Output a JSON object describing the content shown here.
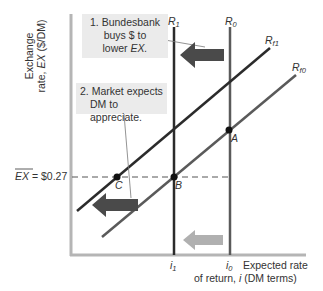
{
  "diagram": {
    "y_axis_label_line1": "Exchange",
    "y_axis_label_line2_prefix": "rate, ",
    "y_axis_label_var": "EX",
    "y_axis_label_unit": " ($/DM)",
    "x_axis_label_line1": "Expected rate",
    "x_axis_label_line2_prefix": "of return, ",
    "x_axis_label_var": "i",
    "x_axis_label_unit": " (DM terms)",
    "note1": {
      "line1": "1. Bundesbank",
      "line2": "buys $ to",
      "line3_prefix": "lower ",
      "line3_var": "EX."
    },
    "note2": {
      "line1": "2. Market expects",
      "line2": "DM to appreciate."
    },
    "fixed_rate_label": "EX",
    "fixed_rate_value": " = $0.27",
    "curves": {
      "R1": {
        "base": "R",
        "sub": "1"
      },
      "R0": {
        "base": "R",
        "sub": "0"
      },
      "Rf1": {
        "base": "R",
        "sub": "f1"
      },
      "Rf0": {
        "base": "R",
        "sub": "f0"
      }
    },
    "points": {
      "A": "A",
      "B": "B",
      "C": "C"
    },
    "x_ticks": {
      "i1": {
        "base": "i",
        "sub": "1"
      },
      "i0": {
        "base": "i",
        "sub": "0"
      }
    },
    "colors": {
      "axis": "#b5b5b5",
      "dark_line": "#2b2b2b",
      "mid_line": "#5a5a5a",
      "arrow_dark": "#4a4a4a",
      "arrow_light": "#b0b0b0",
      "note_bg": "#ebebeb"
    }
  }
}
